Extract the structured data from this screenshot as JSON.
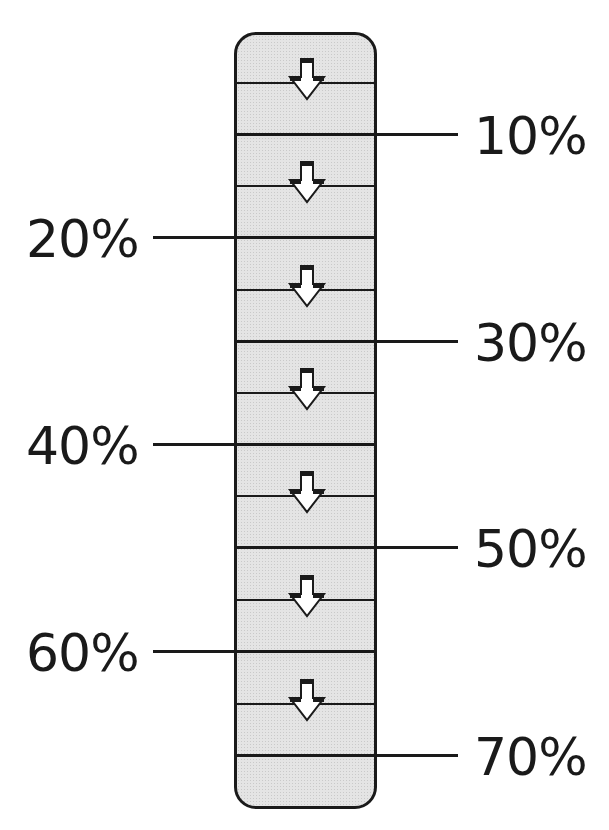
{
  "title": {
    "text": "",
    "note": "clipped at top edge"
  },
  "diagram": {
    "type": "vertical-gauge",
    "segments": 7,
    "arrow_icon": "down-arrow-icon",
    "colors": {
      "fill": "#e4e4e4",
      "stroke": "#1a1a1a"
    },
    "markers": [
      {
        "label": "10%",
        "side": "right"
      },
      {
        "label": "20%",
        "side": "left"
      },
      {
        "label": "30%",
        "side": "right"
      },
      {
        "label": "40%",
        "side": "left"
      },
      {
        "label": "50%",
        "side": "right"
      },
      {
        "label": "60%",
        "side": "left"
      },
      {
        "label": "70%",
        "side": "right"
      }
    ]
  }
}
